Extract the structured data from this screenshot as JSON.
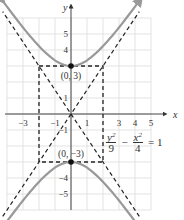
{
  "chart_data": {
    "type": "line",
    "title": "",
    "xlabel": "x",
    "ylabel": "y",
    "xlim": [
      -4,
      5
    ],
    "ylim": [
      -6,
      6
    ],
    "grid": true,
    "x_ticks": [
      {
        "value": -3,
        "label": "−3"
      },
      {
        "value": -1,
        "label": "−1"
      },
      {
        "value": 1,
        "label": "1"
      },
      {
        "value": 3,
        "label": "3"
      },
      {
        "value": 4,
        "label": "4"
      },
      {
        "value": 5,
        "label": "5"
      }
    ],
    "y_ticks": [
      {
        "value": 5,
        "label": "5"
      },
      {
        "value": 4,
        "label": "4"
      },
      {
        "value": 1,
        "label": "1"
      },
      {
        "value": -1,
        "label": "−1"
      },
      {
        "value": -4,
        "label": "−4"
      },
      {
        "value": -5,
        "label": "−5"
      }
    ],
    "hyperbola": {
      "equation": {
        "num1": "y",
        "exp1": "2",
        "den1": "9",
        "minus": "−",
        "num2": "x",
        "exp2": "2",
        "den2": "4",
        "equals": "= 1"
      },
      "a": 3,
      "b": 2,
      "x_range": [
        -4.3,
        4.3
      ],
      "color": "#999999"
    },
    "asymptotes": [
      {
        "name": "asymptote-positive",
        "slope": 1.5,
        "intercept": 0
      },
      {
        "name": "asymptote-negative",
        "slope": -1.5,
        "intercept": 0
      }
    ],
    "box": {
      "x": [
        -2,
        2
      ],
      "y": [
        -3,
        3
      ]
    },
    "vertices": [
      {
        "x": 0,
        "y": 3,
        "label": "(0, 3)"
      },
      {
        "x": 0,
        "y": -3,
        "label": "(0, −3)"
      }
    ]
  }
}
